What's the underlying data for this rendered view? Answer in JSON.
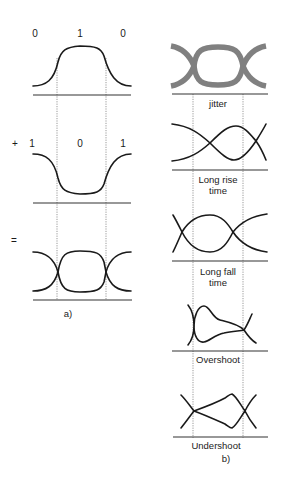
{
  "figure": {
    "panel_a": {
      "caption": "a)",
      "rows": [
        {
          "operator": "",
          "bits": [
            "0",
            "1",
            "0"
          ],
          "description": "Pulse 0-1-0"
        },
        {
          "operator": "+",
          "bits": [
            "1",
            "0",
            "1"
          ],
          "description": "Pulse 1-0-1"
        },
        {
          "operator": "=",
          "bits": [],
          "description": "Resulting eye diagram"
        }
      ]
    },
    "panel_b": {
      "caption": "b)",
      "diagrams": [
        {
          "label": "jitter"
        },
        {
          "label": "Long rise\ntime"
        },
        {
          "label": "Long fall\ntime"
        },
        {
          "label": "Overshoot"
        },
        {
          "label": "Undershoot"
        }
      ]
    },
    "colors": {
      "line": "#1a1a1a",
      "jitter_band": "#808080",
      "background": "#ffffff"
    }
  }
}
